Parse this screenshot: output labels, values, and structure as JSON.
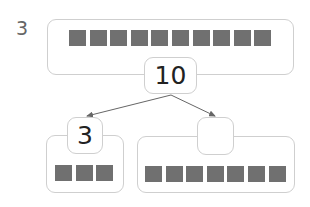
{
  "problem": {
    "number": "3",
    "whole": {
      "value": "10",
      "squares": 10
    },
    "parts": [
      {
        "value": "3",
        "squares": 3
      },
      {
        "value": "",
        "squares": 7
      }
    ]
  },
  "colors": {
    "square": "#707070",
    "border": "#cfcfcf",
    "arrow": "#666666"
  }
}
